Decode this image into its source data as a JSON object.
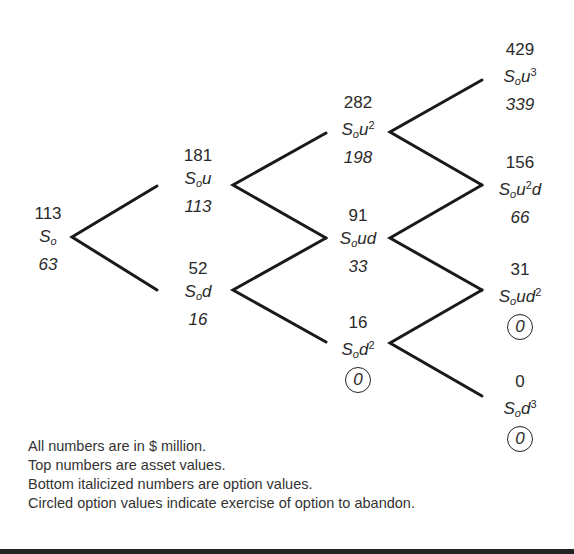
{
  "diagram": {
    "type": "binomial-tree",
    "nodes": [
      {
        "id": "n0",
        "asset": "113",
        "label_base": "S",
        "label_sub": "o",
        "label_suffix": "",
        "label_sup": "",
        "label_tail": "",
        "option": "63",
        "circled": false
      },
      {
        "id": "n1u",
        "asset": "181",
        "label_base": "S",
        "label_sub": "o",
        "label_suffix": "u",
        "label_sup": "",
        "label_tail": "",
        "option": "113",
        "circled": false
      },
      {
        "id": "n1d",
        "asset": "52",
        "label_base": "S",
        "label_sub": "o",
        "label_suffix": "d",
        "label_sup": "",
        "label_tail": "",
        "option": "16",
        "circled": false
      },
      {
        "id": "n2uu",
        "asset": "282",
        "label_base": "S",
        "label_sub": "o",
        "label_suffix": "u",
        "label_sup": "2",
        "label_tail": "",
        "option": "198",
        "circled": false
      },
      {
        "id": "n2ud",
        "asset": "91",
        "label_base": "S",
        "label_sub": "o",
        "label_suffix": "ud",
        "label_sup": "",
        "label_tail": "",
        "option": "33",
        "circled": false
      },
      {
        "id": "n2dd",
        "asset": "16",
        "label_base": "S",
        "label_sub": "o",
        "label_suffix": "d",
        "label_sup": "2",
        "label_tail": "",
        "option": "0",
        "circled": true
      },
      {
        "id": "n3uuu",
        "asset": "429",
        "label_base": "S",
        "label_sub": "o",
        "label_suffix": "u",
        "label_sup": "3",
        "label_tail": "",
        "option": "339",
        "circled": false
      },
      {
        "id": "n3uud",
        "asset": "156",
        "label_base": "S",
        "label_sub": "o",
        "label_suffix": "u",
        "label_sup": "2",
        "label_tail": "d",
        "option": "66",
        "circled": false
      },
      {
        "id": "n3udd",
        "asset": "31",
        "label_base": "S",
        "label_sub": "o",
        "label_suffix": "ud",
        "label_sup": "2",
        "label_tail": "",
        "option": "0",
        "circled": true
      },
      {
        "id": "n3ddd",
        "asset": "0",
        "label_base": "S",
        "label_sub": "o",
        "label_suffix": "d",
        "label_sup": "3",
        "label_tail": "",
        "option": "0",
        "circled": true
      }
    ],
    "notes": [
      "All numbers are in $ million.",
      "Top numbers are asset values.",
      "Bottom italicized numbers are option values.",
      "Circled option values indicate exercise of option to abandon."
    ],
    "line_color": "#1a1a1a"
  }
}
